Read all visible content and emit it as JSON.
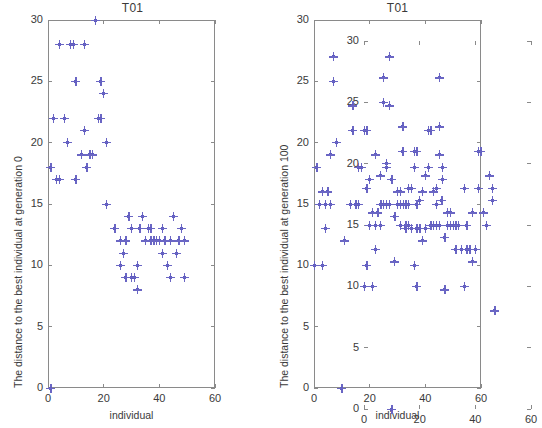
{
  "figure": {
    "width": 530,
    "height": 428,
    "background": "#ffffff",
    "marker_color": "#6a66c4",
    "axis_color": "#8a8a8a",
    "text_color": "#3a3a3a"
  },
  "chart_data": [
    {
      "id": "left",
      "type": "scatter",
      "title": "T01",
      "xlabel": "individual",
      "ylabel": "The distance to the best individual at generation 0",
      "xlim": [
        0,
        60
      ],
      "ylim": [
        0,
        30
      ],
      "xticks": [
        0,
        20,
        40,
        60
      ],
      "yticks": [
        0,
        5,
        10,
        15,
        20,
        25,
        30
      ],
      "grid": false,
      "legend": null,
      "marker": "plus",
      "points": [
        {
          "x": 1,
          "y": 0
        },
        {
          "x": 1,
          "y": 18
        },
        {
          "x": 2,
          "y": 22
        },
        {
          "x": 3,
          "y": 17
        },
        {
          "x": 4,
          "y": 17
        },
        {
          "x": 4,
          "y": 28
        },
        {
          "x": 6,
          "y": 22
        },
        {
          "x": 7,
          "y": 20
        },
        {
          "x": 8,
          "y": 28
        },
        {
          "x": 9,
          "y": 28
        },
        {
          "x": 10,
          "y": 25
        },
        {
          "x": 10,
          "y": 17
        },
        {
          "x": 12,
          "y": 19
        },
        {
          "x": 13,
          "y": 21
        },
        {
          "x": 13,
          "y": 28
        },
        {
          "x": 14,
          "y": 18
        },
        {
          "x": 15,
          "y": 19
        },
        {
          "x": 16,
          "y": 19
        },
        {
          "x": 17,
          "y": 30
        },
        {
          "x": 18,
          "y": 22
        },
        {
          "x": 19,
          "y": 25
        },
        {
          "x": 19,
          "y": 22
        },
        {
          "x": 20,
          "y": 24
        },
        {
          "x": 21,
          "y": 15
        },
        {
          "x": 21,
          "y": 20
        },
        {
          "x": 24,
          "y": 13
        },
        {
          "x": 26,
          "y": 12
        },
        {
          "x": 26,
          "y": 10
        },
        {
          "x": 27,
          "y": 11
        },
        {
          "x": 28,
          "y": 9
        },
        {
          "x": 28,
          "y": 12
        },
        {
          "x": 29,
          "y": 14
        },
        {
          "x": 30,
          "y": 13
        },
        {
          "x": 30,
          "y": 9
        },
        {
          "x": 31,
          "y": 9
        },
        {
          "x": 32,
          "y": 10
        },
        {
          "x": 32,
          "y": 8
        },
        {
          "x": 33,
          "y": 13
        },
        {
          "x": 34,
          "y": 14
        },
        {
          "x": 35,
          "y": 12
        },
        {
          "x": 36,
          "y": 13
        },
        {
          "x": 37,
          "y": 13
        },
        {
          "x": 37,
          "y": 12
        },
        {
          "x": 38,
          "y": 12
        },
        {
          "x": 39,
          "y": 12
        },
        {
          "x": 40,
          "y": 12
        },
        {
          "x": 41,
          "y": 11
        },
        {
          "x": 41,
          "y": 13
        },
        {
          "x": 42,
          "y": 12
        },
        {
          "x": 43,
          "y": 10
        },
        {
          "x": 44,
          "y": 9
        },
        {
          "x": 44,
          "y": 12
        },
        {
          "x": 45,
          "y": 14
        },
        {
          "x": 46,
          "y": 11
        },
        {
          "x": 47,
          "y": 12
        },
        {
          "x": 48,
          "y": 13
        },
        {
          "x": 49,
          "y": 12
        },
        {
          "x": 49,
          "y": 9
        }
      ]
    },
    {
      "id": "right",
      "type": "scatter",
      "title": "T01",
      "xlabel": "individual",
      "ylabel": "The distance to the best individual at generation 100",
      "xlim": [
        0,
        60
      ],
      "ylim": [
        0,
        30
      ],
      "xticks": [
        0,
        20,
        40,
        60
      ],
      "yticks": [
        0,
        5,
        10,
        15,
        20,
        25,
        30
      ],
      "grid": false,
      "legend": null,
      "marker": "plus",
      "points": [
        {
          "x": 0,
          "y": 10
        },
        {
          "x": 1,
          "y": 18
        },
        {
          "x": 2,
          "y": 15
        },
        {
          "x": 3,
          "y": 16
        },
        {
          "x": 3,
          "y": 10
        },
        {
          "x": 4,
          "y": 13
        },
        {
          "x": 4,
          "y": 15
        },
        {
          "x": 5,
          "y": 16
        },
        {
          "x": 6,
          "y": 19
        },
        {
          "x": 6,
          "y": 15
        },
        {
          "x": 7,
          "y": 25
        },
        {
          "x": 7,
          "y": 27
        },
        {
          "x": 8,
          "y": 20
        },
        {
          "x": 10,
          "y": 0
        },
        {
          "x": 11,
          "y": 12
        },
        {
          "x": 13,
          "y": 15
        },
        {
          "x": 14,
          "y": 23
        },
        {
          "x": 14,
          "y": 21
        },
        {
          "x": 15,
          "y": 15
        },
        {
          "x": 16,
          "y": 18
        },
        {
          "x": 16,
          "y": 15
        },
        {
          "x": 17,
          "y": 18
        },
        {
          "x": 18,
          "y": 21
        },
        {
          "x": 19,
          "y": 10
        },
        {
          "x": 19,
          "y": 21
        },
        {
          "x": 20,
          "y": 17
        },
        {
          "x": 22,
          "y": 19
        },
        {
          "x": 24,
          "y": 15
        },
        {
          "x": 25,
          "y": 15
        },
        {
          "x": 26,
          "y": 18
        },
        {
          "x": 26,
          "y": 15
        },
        {
          "x": 27,
          "y": 23
        },
        {
          "x": 27,
          "y": 27
        },
        {
          "x": 27,
          "y": 15
        },
        {
          "x": 28,
          "y": 17
        },
        {
          "x": 29,
          "y": 14
        },
        {
          "x": 30,
          "y": 16
        },
        {
          "x": 30,
          "y": 15
        },
        {
          "x": 31,
          "y": 16
        },
        {
          "x": 31,
          "y": 15
        },
        {
          "x": 32,
          "y": 15
        },
        {
          "x": 33,
          "y": 13
        },
        {
          "x": 33,
          "y": 15
        },
        {
          "x": 34,
          "y": 15
        },
        {
          "x": 35,
          "y": 13
        },
        {
          "x": 36,
          "y": 10
        },
        {
          "x": 36,
          "y": 18
        },
        {
          "x": 37,
          "y": 13
        },
        {
          "x": 37,
          "y": 15
        },
        {
          "x": 38,
          "y": 13
        },
        {
          "x": 39,
          "y": 16
        },
        {
          "x": 39,
          "y": 12
        },
        {
          "x": 40,
          "y": 13
        },
        {
          "x": 41,
          "y": 21
        },
        {
          "x": 41,
          "y": 18
        },
        {
          "x": 42,
          "y": 21
        },
        {
          "x": 43,
          "y": 16
        },
        {
          "x": 44,
          "y": 15
        },
        {
          "x": 45,
          "y": 19
        },
        {
          "x": 46,
          "y": 17
        },
        {
          "x": 46,
          "y": 18
        },
        {
          "x": 47,
          "y": 8
        }
      ]
    }
  ]
}
